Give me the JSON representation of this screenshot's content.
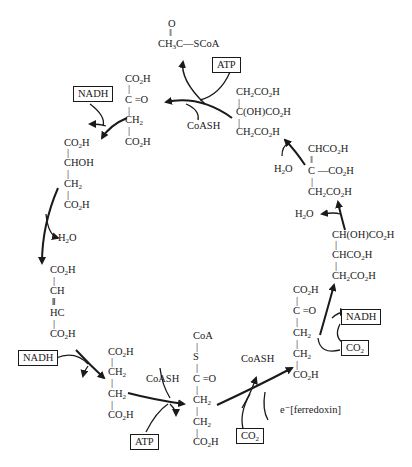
{
  "diagram": {
    "type": "metabolic-cycle",
    "molecules": {
      "acetyl_coa": [
        "O",
        "‖",
        "CH3C—SCoA"
      ],
      "citrate": [
        "CH2CO2H",
        "|",
        "C(OH)CO2H",
        "|",
        "CH2CO2H"
      ],
      "oxaloacetate": [
        "CO2H",
        "|",
        "C =O",
        "|",
        "CH2",
        "|",
        "CO2H"
      ],
      "malate": [
        "CO2H",
        "|",
        "CHOH",
        "|",
        "CH2",
        "|",
        "CO2H"
      ],
      "fumarate": [
        "CO2H",
        "|",
        "CH",
        "‖",
        "HC",
        "|",
        "CO2H"
      ],
      "succinate": [
        "CO2H",
        "|",
        "CH2",
        "|",
        "CH2",
        "|",
        "CO2H"
      ],
      "succinyl_coa": [
        "CoA",
        "|",
        "S",
        "|",
        "C =O",
        "|",
        "CH2",
        "|",
        "CH2",
        "|",
        "CO2H"
      ],
      "alpha_ketoglutarate": [
        "CO2H",
        "|",
        "C =O",
        "|",
        "CH2",
        "|",
        "CH2",
        "|",
        "CO2H"
      ],
      "isocitrate": [
        "CH(OH)CO2H",
        "|",
        "CHCO2H",
        "|",
        "CH2CO2H"
      ],
      "cis_aconitate": [
        "CHCO2H",
        "‖",
        "C —CO2H",
        "|",
        "CH2CO2H"
      ]
    },
    "cofactors": {
      "atp_top": "ATP",
      "coash_top": "CoASH",
      "nadh_left": "NADH",
      "h2o_left": "H2O",
      "nadh_bottom_left": "NADH",
      "coash_bottom": "CoASH",
      "atp_bottom": "ATP",
      "co2_bottom": "CO2",
      "coash_bottom_right": "CoASH",
      "ferredoxin": "e⁻[ferredoxin]",
      "nadh_right": "NADH",
      "co2_right": "CO2",
      "h2o_right_lower": "H2O",
      "h2o_right_upper": "H2O"
    }
  }
}
